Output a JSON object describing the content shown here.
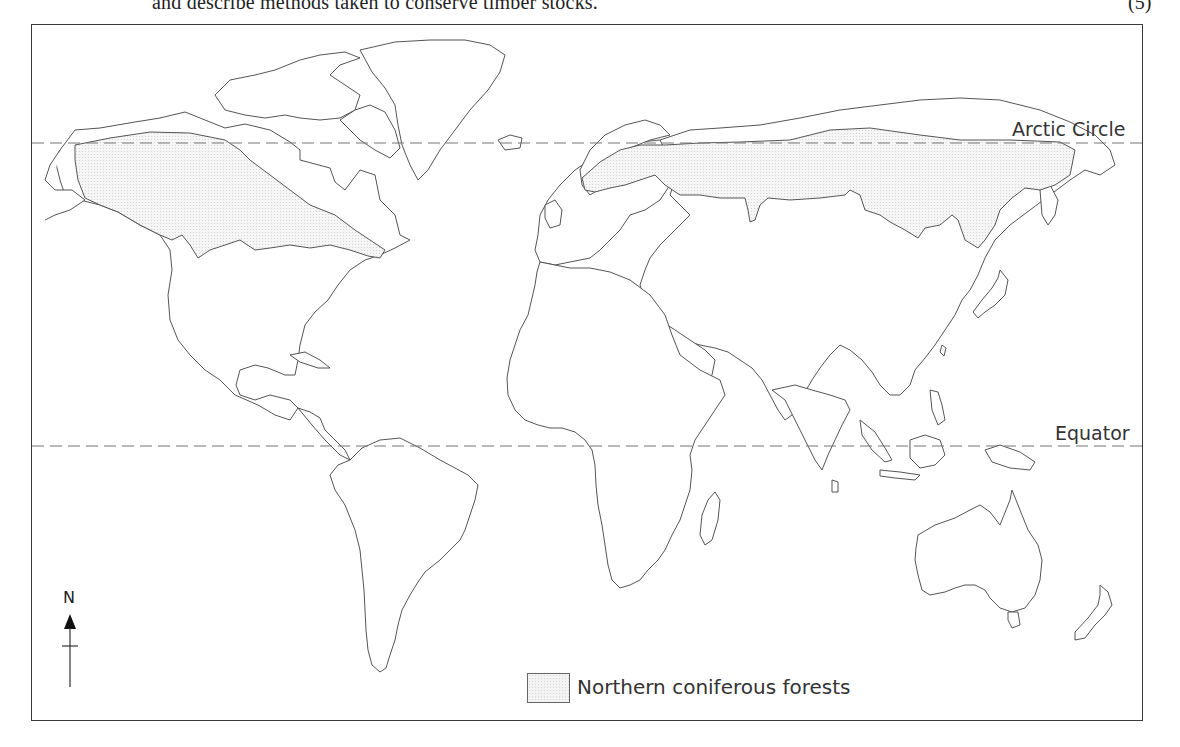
{
  "question": {
    "text": "and describe methods taken to conserve timber stocks.",
    "marks": "(5)"
  },
  "map": {
    "type": "world outline map",
    "lines": [
      {
        "name": "Arctic Circle",
        "label": "Arctic Circle",
        "style": "dashed"
      },
      {
        "name": "Equator",
        "label": "Equator",
        "style": "dashed"
      }
    ],
    "compass": {
      "label": "N",
      "direction": "north"
    },
    "shaded_region": "Northern coniferous forests (boreal band across North America and Eurasia, just south of the Arctic Circle)"
  },
  "legend": {
    "items": [
      {
        "swatch": "stippled-grey",
        "label": "Northern coniferous forests"
      }
    ]
  }
}
